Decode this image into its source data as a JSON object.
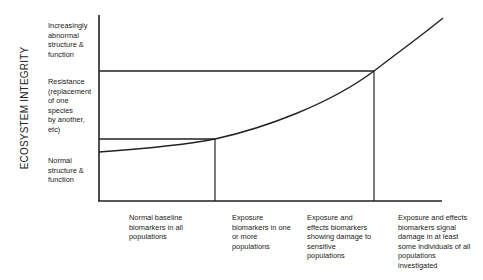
{
  "diagram": {
    "y_axis_title": "ECOSYSTEM INTEGRITY",
    "y_levels": [
      {
        "id": "abnormal",
        "lines": [
          "Increasingly",
          "abnormal",
          "structure &",
          "function"
        ]
      },
      {
        "id": "resistance",
        "lines": [
          "Resistance",
          "(replacement",
          "of one",
          "species",
          "by another,",
          "etc)"
        ]
      },
      {
        "id": "normal",
        "lines": [
          "Normal",
          "structure &",
          "function"
        ]
      }
    ],
    "x_stages": [
      {
        "id": "stage-1",
        "lines": [
          "Normal baseline",
          "biomarkers in all",
          "populations"
        ]
      },
      {
        "id": "stage-2",
        "lines": [
          "Exposure",
          "biomarkers in one",
          "or more",
          "populations"
        ]
      },
      {
        "id": "stage-3",
        "lines": [
          "Exposure and",
          "effects biomarkers",
          "showing damage to",
          "sensitive",
          "populations"
        ]
      },
      {
        "id": "stage-4",
        "lines": [
          "Exposure and effects",
          "biomarkers signal",
          "damage in at least",
          "some individuals of all",
          "populations",
          "investigated"
        ]
      }
    ],
    "curve": {
      "description": "Ecosystem integrity response curve rising non-linearly across stages",
      "points_px": [
        [
          99,
          152
        ],
        [
          215,
          139
        ],
        [
          374,
          71
        ],
        [
          443,
          18
        ]
      ]
    },
    "thresholds": [
      {
        "name": "normal-threshold",
        "y_px": 139,
        "x_end_px": 215
      },
      {
        "name": "resistance-threshold",
        "y_px": 71,
        "x_end_px": 374
      }
    ],
    "colors": {
      "line": "#222222",
      "text": "#1a1a1a",
      "background": "#ffffff"
    }
  }
}
